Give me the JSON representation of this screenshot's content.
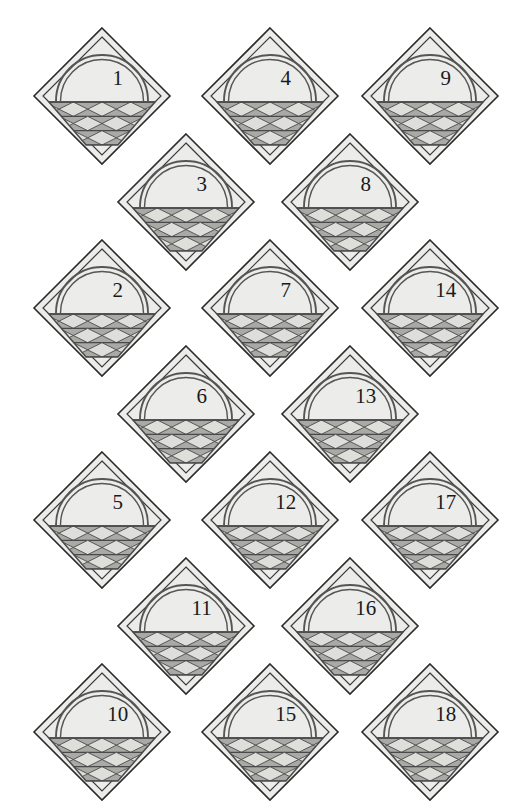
{
  "figure": {
    "kind": "quilt-block-diagram",
    "background_color": "#ffffff",
    "block_count": 18,
    "block_size_px": 136
  },
  "style": {
    "diamond_fill": "#ececeb",
    "diamond_stroke": "#2b2b2b",
    "inner_frame_stroke": "#3a3a3a",
    "basket_fill": "#a9a9a6",
    "basket_light_fill": "#dededa",
    "basket_stroke": "#4a4a4a",
    "handle_stroke": "#555553",
    "number_color": "#1a1a1a",
    "number_font_size": 21
  },
  "blocks": [
    {
      "id": "block-1",
      "number": "1",
      "cx": 102,
      "cy": 96
    },
    {
      "id": "block-4",
      "number": "4",
      "cx": 270,
      "cy": 96
    },
    {
      "id": "block-9",
      "number": "9",
      "cx": 430,
      "cy": 96
    },
    {
      "id": "block-3",
      "number": "3",
      "cx": 186,
      "cy": 202
    },
    {
      "id": "block-8",
      "number": "8",
      "cx": 350,
      "cy": 202
    },
    {
      "id": "block-2",
      "number": "2",
      "cx": 102,
      "cy": 308
    },
    {
      "id": "block-7",
      "number": "7",
      "cx": 270,
      "cy": 308
    },
    {
      "id": "block-14",
      "number": "14",
      "cx": 430,
      "cy": 308
    },
    {
      "id": "block-6",
      "number": "6",
      "cx": 186,
      "cy": 414
    },
    {
      "id": "block-13",
      "number": "13",
      "cx": 350,
      "cy": 414
    },
    {
      "id": "block-5",
      "number": "5",
      "cx": 102,
      "cy": 520
    },
    {
      "id": "block-12",
      "number": "12",
      "cx": 270,
      "cy": 520
    },
    {
      "id": "block-17",
      "number": "17",
      "cx": 430,
      "cy": 520
    },
    {
      "id": "block-11",
      "number": "11",
      "cx": 186,
      "cy": 626
    },
    {
      "id": "block-16",
      "number": "16",
      "cx": 350,
      "cy": 626
    },
    {
      "id": "block-10",
      "number": "10",
      "cx": 102,
      "cy": 732
    },
    {
      "id": "block-15",
      "number": "15",
      "cx": 270,
      "cy": 732
    },
    {
      "id": "block-18",
      "number": "18",
      "cx": 430,
      "cy": 732
    }
  ],
  "legend": {
    "numbers_in_reading_order": [
      "1",
      "4",
      "9",
      "3",
      "8",
      "2",
      "7",
      "14",
      "6",
      "13",
      "5",
      "12",
      "17",
      "11",
      "16",
      "10",
      "15",
      "18"
    ]
  }
}
